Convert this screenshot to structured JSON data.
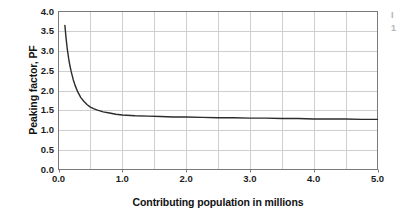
{
  "chart_data": {
    "type": "line",
    "title": "",
    "xlabel": "Contributing population in millions",
    "ylabel": "Peaking factor, PF",
    "xlim": [
      0.0,
      5.0
    ],
    "ylim": [
      0.0,
      4.0
    ],
    "xticks": [
      "0.0",
      "1.0",
      "2.0",
      "3.0",
      "4.0",
      "5.0"
    ],
    "xtick_values": [
      0.0,
      1.0,
      2.0,
      3.0,
      4.0,
      5.0
    ],
    "yticks": [
      "0.0",
      "0.5",
      "1.0",
      "1.5",
      "2.0",
      "2.5",
      "3.0",
      "3.5",
      "4.0"
    ],
    "ytick_values": [
      0.0,
      0.5,
      1.0,
      1.5,
      2.0,
      2.5,
      3.0,
      3.5,
      4.0
    ],
    "grid": true,
    "grid_x_step": 0.5,
    "grid_y_step": 0.5,
    "legend": "",
    "annotations": [],
    "series": [
      {
        "name": "Peaking factor",
        "color": "#2b2b2b",
        "x": [
          0.1,
          0.12,
          0.14,
          0.16,
          0.18,
          0.2,
          0.23,
          0.26,
          0.3,
          0.35,
          0.4,
          0.45,
          0.5,
          0.55,
          0.6,
          0.7,
          0.8,
          0.9,
          1.0,
          1.2,
          1.4,
          1.6,
          1.8,
          2.0,
          2.25,
          2.5,
          2.75,
          3.0,
          3.25,
          3.5,
          3.75,
          4.0,
          4.25,
          4.5,
          4.75,
          5.0
        ],
        "values": [
          3.65,
          3.3,
          3.02,
          2.8,
          2.62,
          2.47,
          2.28,
          2.13,
          1.97,
          1.82,
          1.72,
          1.64,
          1.58,
          1.54,
          1.51,
          1.46,
          1.43,
          1.4,
          1.38,
          1.36,
          1.35,
          1.34,
          1.33,
          1.33,
          1.32,
          1.31,
          1.31,
          1.3,
          1.3,
          1.29,
          1.29,
          1.28,
          1.28,
          1.28,
          1.27,
          1.27
        ]
      }
    ]
  },
  "axes": {
    "frame_color": "#7a7a7a",
    "grid_color": "#cfcfcf",
    "tick_color": "#1c1c1c"
  },
  "edge_bleed": {
    "line1": "I",
    "line2": "1"
  }
}
